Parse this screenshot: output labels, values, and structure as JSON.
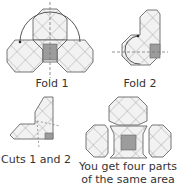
{
  "steps": [
    {
      "label": "Fold 1"
    },
    {
      "label": "Fold 2"
    },
    {
      "label": "Cuts 1 and 2"
    },
    {
      "label_line1": "You get four parts",
      "label_line2": "of the same area"
    }
  ],
  "colors": {
    "outline": "#555555",
    "hatch": "#9a9a9a",
    "fill": "#f0f0f0",
    "center_square": "#999999",
    "dashed": "#777777"
  }
}
